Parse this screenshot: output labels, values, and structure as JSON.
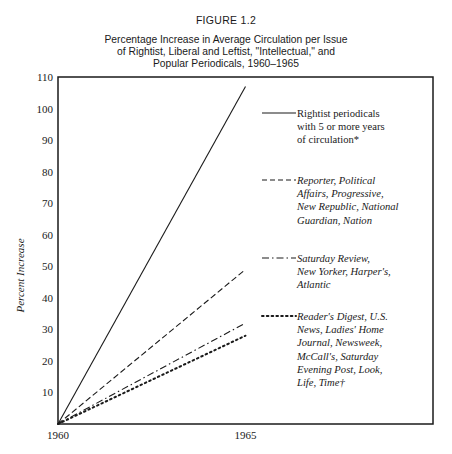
{
  "figure_label": "FIGURE 1.2",
  "title_lines": [
    "Percentage Increase in Average Circulation per Issue",
    "of Rightist, Liberal and Leftist, \"Intellectual,\" and",
    "Popular Periodicals, 1960–1965"
  ],
  "chart_data": {
    "type": "line",
    "title": "Percentage Increase in Average Circulation per Issue of Rightist, Liberal and Leftist, \"Intellectual,\" and Popular Periodicals, 1960–1965",
    "xlabel": "",
    "ylabel": "Percent Increase",
    "x": [
      1960,
      1965
    ],
    "xlim": [
      1960,
      1970
    ],
    "ylim": [
      0,
      110
    ],
    "x_ticks": [
      "1960",
      "1965"
    ],
    "y_ticks": [
      10,
      20,
      30,
      40,
      50,
      60,
      70,
      80,
      90,
      100,
      110
    ],
    "grid": false,
    "legend_position": "right",
    "series": [
      {
        "name": "Rightist periodicals with 5 or more years of circulation*",
        "style": "solid",
        "italic": false,
        "legend_lines": [
          "Rightist periodicals",
          "with 5 or more years",
          "of circulation*"
        ],
        "values": [
          0,
          107
        ]
      },
      {
        "name": "Reporter, Political Affairs, Progressive, New Republic, National Guardian, Nation",
        "style": "dashed",
        "italic": true,
        "legend_lines": [
          "Reporter, Political",
          "Affairs, Progressive,",
          "New Republic, National",
          "Guardian, Nation"
        ],
        "values": [
          0,
          49
        ]
      },
      {
        "name": "Saturday Review, New Yorker, Harper's, Atlantic",
        "style": "dash-dot",
        "italic": true,
        "legend_lines": [
          "Saturday Review,",
          "New Yorker, Harper's,",
          "Atlantic"
        ],
        "values": [
          0,
          32
        ]
      },
      {
        "name": "Reader's Digest, U.S. News, Ladies' Home Journal, Newsweek, McCall's, Saturday Evening Post, Look, Life, Time†",
        "style": "dotted",
        "italic": true,
        "legend_lines": [
          "Reader's Digest, U.S.",
          "News, Ladies' Home",
          "Journal, Newsweek,",
          "McCall's, Saturday",
          "Evening Post, Look,",
          "Life, Time†"
        ],
        "values": [
          0,
          28
        ]
      }
    ]
  }
}
